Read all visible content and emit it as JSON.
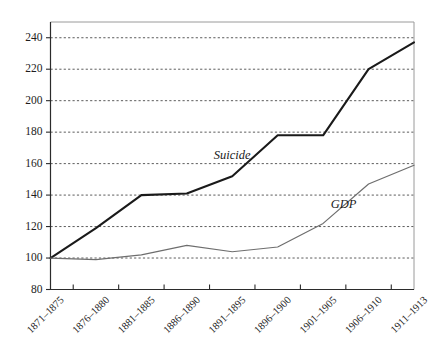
{
  "chart_data": {
    "type": "line",
    "title": "",
    "subtitle": "",
    "xlabel": "",
    "ylabel": "",
    "ylim": [
      80,
      250
    ],
    "yticks": [
      80,
      100,
      120,
      140,
      160,
      180,
      200,
      220,
      240
    ],
    "ytick_labels": [
      "80",
      "100",
      "120",
      "140",
      "160",
      "180",
      "200",
      "220",
      "240"
    ],
    "grid": true,
    "legend_position": "inline-annotation",
    "categories": [
      "1871–1875",
      "1876–1880",
      "1881–1885",
      "1886–1890",
      "1891–1895",
      "1896–1900",
      "1901–1905",
      "1906–1910",
      "1911–1913"
    ],
    "series": [
      {
        "name": "Suicide",
        "color": "#1a1a1a",
        "width": 2.1,
        "values": [
          100,
          119,
          140,
          141,
          152,
          178,
          178,
          220,
          237
        ]
      },
      {
        "name": "GDP",
        "color": "#6e6e6e",
        "width": 1.2,
        "values": [
          100,
          99,
          102,
          108,
          104,
          107,
          122,
          147,
          159
        ]
      }
    ],
    "annotations": [
      {
        "text": "Suicide",
        "category_index": 4,
        "value": 163
      },
      {
        "text": "GDP",
        "category_index": 6.45,
        "value": 132
      }
    ]
  }
}
